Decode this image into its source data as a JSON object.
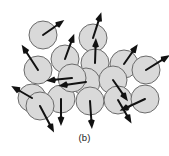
{
  "figure": {
    "caption": "(b)",
    "title": "",
    "colors": {
      "background": "#ffffff",
      "grain_fill": "#d9d9d9",
      "grain_stroke": "#6b6b6b",
      "arrow_color": "#111111",
      "caption_color": "#222222"
    },
    "grain_radius": 14,
    "grain_count": 16,
    "arrow_count": 16
  },
  "chart_data": {
    "type": "scatter",
    "title": "",
    "xlabel": "",
    "ylabel": "",
    "xlim": [
      0,
      169
    ],
    "ylim": [
      0,
      156
    ],
    "grid": false,
    "legend": "none",
    "annotations": [
      "(b)"
    ],
    "series": [
      {
        "name": "grains",
        "marker": "circle",
        "points": [
          {
            "id": "grain-1",
            "cx": 43,
            "cy": 35,
            "r": 14,
            "arrow_angle_deg": 35,
            "arrow_len": 26
          },
          {
            "id": "grain-2",
            "cx": 93,
            "cy": 38,
            "r": 14,
            "arrow_angle_deg": 72,
            "arrow_len": 27
          },
          {
            "id": "grain-3",
            "cx": 65,
            "cy": 59,
            "r": 14,
            "arrow_angle_deg": 70,
            "arrow_len": 27
          },
          {
            "id": "grain-4",
            "cx": 95,
            "cy": 63,
            "r": 14,
            "arrow_angle_deg": 88,
            "arrow_len": 25
          },
          {
            "id": "grain-5",
            "cx": 124,
            "cy": 64,
            "r": 14,
            "arrow_angle_deg": 55,
            "arrow_len": 24
          },
          {
            "id": "grain-6",
            "cx": 146,
            "cy": 70,
            "r": 14,
            "arrow_angle_deg": 32,
            "arrow_len": 28
          },
          {
            "id": "grain-7",
            "cx": 38,
            "cy": 70,
            "r": 14,
            "arrow_angle_deg": 123,
            "arrow_len": 30
          },
          {
            "id": "grain-8",
            "cx": 86,
            "cy": 82,
            "r": 14,
            "arrow_angle_deg": 188,
            "arrow_len": 28
          },
          {
            "id": "grain-9",
            "cx": 113,
            "cy": 80,
            "r": 14,
            "arrow_angle_deg": -55,
            "arrow_len": 26
          },
          {
            "id": "grain-10",
            "cx": 32,
            "cy": 98,
            "r": 14,
            "arrow_angle_deg": 150,
            "arrow_len": 24
          },
          {
            "id": "grain-11",
            "cx": 61,
            "cy": 99,
            "r": 14,
            "arrow_angle_deg": -90,
            "arrow_len": 27
          },
          {
            "id": "grain-12",
            "cx": 90,
            "cy": 101,
            "r": 14,
            "arrow_angle_deg": -86,
            "arrow_len": 28
          },
          {
            "id": "grain-13",
            "cx": 118,
            "cy": 100,
            "r": 14,
            "arrow_angle_deg": -60,
            "arrow_len": 27
          },
          {
            "id": "grain-14",
            "cx": 145,
            "cy": 99,
            "r": 14,
            "arrow_angle_deg": 205,
            "arrow_len": 28
          },
          {
            "id": "grain-15",
            "cx": 40,
            "cy": 106,
            "r": 14,
            "arrow_angle_deg": -62,
            "arrow_len": 30
          },
          {
            "id": "grain-16",
            "cx": 72,
            "cy": 78,
            "r": 14,
            "arrow_angle_deg": 186,
            "arrow_len": 26
          }
        ]
      }
    ]
  }
}
